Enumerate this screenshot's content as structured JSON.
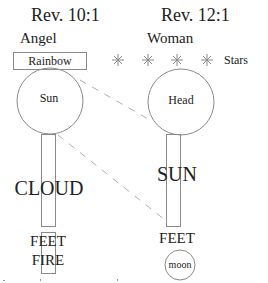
{
  "left": {
    "title": "Rev. 10:1",
    "subject": "Angel",
    "rainbow_label": "Rainbow",
    "head_label": "Sun",
    "body_label": "CLOUD",
    "feet_label": "FEET",
    "feet_sub_label": "FIRE"
  },
  "right": {
    "title": "Rev. 12:1",
    "subject": "Woman",
    "stars_label": "Stars",
    "star_count": 4,
    "head_label": "Head",
    "body_label": "SUN",
    "feet_label": "FEET",
    "moon_label": "moon"
  },
  "colors": {
    "stroke": "#8a8a8a",
    "dashed": "#b0b0b0",
    "text": "#222222"
  }
}
